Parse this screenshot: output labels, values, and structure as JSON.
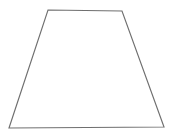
{
  "canvas": {
    "width": 175,
    "height": 139,
    "background_color": "#ffffff",
    "title": "Trapezoid Figure"
  },
  "figure": {
    "name": "trapezoid",
    "shape_type": "isosceles trapezoid",
    "stroke_color": "#6f6f6f",
    "fill_color": "#ffffff",
    "stroke_width": 1.15,
    "vertices": [
      {
        "label": "top-left",
        "x": 48,
        "y": 10
      },
      {
        "label": "top-right",
        "x": 122,
        "y": 11
      },
      {
        "label": "bottom-right",
        "x": 164,
        "y": 127
      },
      {
        "label": "bottom-left",
        "x": 9,
        "y": 128
      }
    ],
    "points_attribute": "48,10 122,11 164,127 9,128",
    "edges": [
      {
        "label": "top-side",
        "length_px": 74
      },
      {
        "label": "right-side",
        "length_px": 123
      },
      {
        "label": "bottom-side",
        "length_px": 155
      },
      {
        "label": "left-side",
        "length_px": 124
      }
    ],
    "labels": []
  }
}
